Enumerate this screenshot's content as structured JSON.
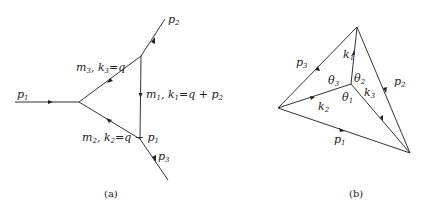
{
  "diagrams": [
    {
      "caption": "(a)",
      "external_lines": [
        {
          "name": "p",
          "sub": "1"
        },
        {
          "name": "p",
          "sub": "2"
        },
        {
          "name": "p",
          "sub": "3"
        }
      ],
      "internal_lines": [
        {
          "mass": "m",
          "mass_sub": "3",
          "mom": "k",
          "mom_sub": "3",
          "eq": "=q"
        },
        {
          "mass": "m",
          "mass_sub": "1",
          "mom": "k",
          "mom_sub": "1",
          "eq": "=q + p",
          "eq_sub": "2"
        },
        {
          "mass": "m",
          "mass_sub": "2",
          "mom": "k",
          "mom_sub": "2",
          "eq": "=q − p",
          "eq_sub": "1"
        }
      ]
    },
    {
      "caption": "(b)",
      "outer_edges": [
        {
          "name": "p",
          "sub": "1"
        },
        {
          "name": "p",
          "sub": "2"
        },
        {
          "name": "p",
          "sub": "3"
        }
      ],
      "inner_edges": [
        {
          "name": "k",
          "sub": "1"
        },
        {
          "name": "k",
          "sub": "2"
        },
        {
          "name": "k",
          "sub": "3"
        }
      ],
      "angles": [
        {
          "name": "θ",
          "sub": "1"
        },
        {
          "name": "θ",
          "sub": "2"
        },
        {
          "name": "θ",
          "sub": "3"
        }
      ]
    }
  ]
}
